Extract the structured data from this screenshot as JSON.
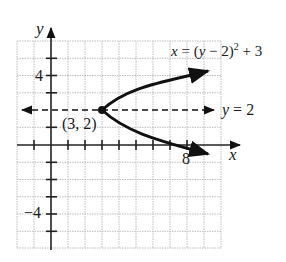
{
  "figure": {
    "type": "coordinate-graph",
    "axis_labels": {
      "x": "x",
      "y": "y"
    },
    "x_range": [
      -2,
      10
    ],
    "y_range": [
      -6,
      6
    ],
    "tick_labels": {
      "x": [
        {
          "value": 8,
          "label": "8"
        }
      ],
      "y": [
        {
          "value": 4,
          "label": "4"
        },
        {
          "value": -4,
          "label": "−4"
        }
      ]
    },
    "curve": {
      "equation_label": "x = (y − 2)² + 3",
      "eq_lhs": "x",
      "eq_mid": " = (",
      "eq_y": "y",
      "eq_rest": " − 2)",
      "eq_exp": "2",
      "eq_tail": " + 3"
    },
    "axis_of_symmetry": {
      "label_var": "y",
      "label_rest": " = 2",
      "value": 2,
      "style": "dashed"
    },
    "vertex": {
      "label": "(3, 2)",
      "x": 3,
      "y": 2
    },
    "colors": {
      "curve": "#111111",
      "grid": "#bfbfbf",
      "axis": "#222222"
    }
  }
}
